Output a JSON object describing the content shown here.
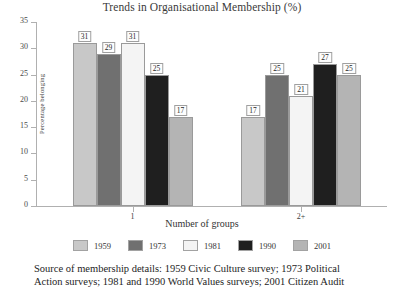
{
  "chart_data": {
    "type": "bar",
    "title": "Trends in Organisational Membership (%)",
    "xlabel": "Number of groups",
    "ylabel": "Percentage belonging",
    "categories": [
      "1",
      "2+"
    ],
    "ylim": [
      0,
      35
    ],
    "yticks": [
      0,
      5,
      10,
      15,
      20,
      25,
      30,
      35
    ],
    "grid": false,
    "legend_position": "bottom",
    "series": [
      {
        "name": "1959",
        "values": [
          31,
          17
        ],
        "color": "#c8c8c8"
      },
      {
        "name": "1973",
        "values": [
          29,
          25
        ],
        "color": "#707070"
      },
      {
        "name": "1981",
        "values": [
          31,
          21
        ],
        "color": "#f4f4f4"
      },
      {
        "name": "1990",
        "values": [
          25,
          27
        ],
        "color": "#1f1f1f"
      },
      {
        "name": "2001",
        "values": [
          17,
          25
        ],
        "color": "#b4b4b4"
      }
    ]
  },
  "source": {
    "line1": "Source of membership details: 1959 Civic Culture survey; 1973 Political",
    "line2": "Action surveys; 1981 and 1990 World Values surveys; 2001 Citizen Audit"
  }
}
